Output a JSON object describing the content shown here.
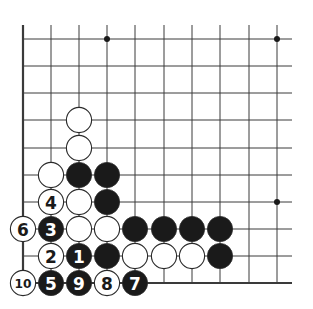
{
  "diagram": {
    "type": "go-board-diagram",
    "line_color": "#3a3a3a",
    "black_color": "#1a1a1a",
    "white_color": "#ffffff",
    "columns_x": [
      23,
      51,
      79,
      107,
      135,
      164,
      192,
      220,
      249,
      277
    ],
    "rows_y": [
      39,
      66,
      93,
      120,
      148,
      175,
      202,
      229,
      256,
      283
    ],
    "line_extent": {
      "top": 25,
      "right": 292
    },
    "edges": [
      "left",
      "bottom"
    ],
    "hoshi": [
      {
        "col": 3,
        "row": 0
      },
      {
        "col": 9,
        "row": 0
      },
      {
        "col": 9,
        "row": 6
      }
    ],
    "stones": [
      {
        "col": 2,
        "row": 3,
        "color": "white",
        "label": ""
      },
      {
        "col": 2,
        "row": 4,
        "color": "white",
        "label": ""
      },
      {
        "col": 1,
        "row": 5,
        "color": "white",
        "label": ""
      },
      {
        "col": 2,
        "row": 5,
        "color": "black",
        "label": ""
      },
      {
        "col": 3,
        "row": 5,
        "color": "black",
        "label": ""
      },
      {
        "col": 1,
        "row": 6,
        "color": "white",
        "label": "4"
      },
      {
        "col": 2,
        "row": 6,
        "color": "white",
        "label": ""
      },
      {
        "col": 3,
        "row": 6,
        "color": "black",
        "label": ""
      },
      {
        "col": 0,
        "row": 7,
        "color": "white",
        "label": "6"
      },
      {
        "col": 1,
        "row": 7,
        "color": "black",
        "label": "3"
      },
      {
        "col": 2,
        "row": 7,
        "color": "white",
        "label": ""
      },
      {
        "col": 3,
        "row": 7,
        "color": "white",
        "label": ""
      },
      {
        "col": 4,
        "row": 7,
        "color": "black",
        "label": ""
      },
      {
        "col": 5,
        "row": 7,
        "color": "black",
        "label": ""
      },
      {
        "col": 6,
        "row": 7,
        "color": "black",
        "label": ""
      },
      {
        "col": 7,
        "row": 7,
        "color": "black",
        "label": ""
      },
      {
        "col": 1,
        "row": 8,
        "color": "white",
        "label": "2"
      },
      {
        "col": 2,
        "row": 8,
        "color": "black",
        "label": "1"
      },
      {
        "col": 3,
        "row": 8,
        "color": "black",
        "label": ""
      },
      {
        "col": 4,
        "row": 8,
        "color": "white",
        "label": ""
      },
      {
        "col": 5,
        "row": 8,
        "color": "white",
        "label": ""
      },
      {
        "col": 6,
        "row": 8,
        "color": "white",
        "label": ""
      },
      {
        "col": 7,
        "row": 8,
        "color": "black",
        "label": ""
      },
      {
        "col": 0,
        "row": 9,
        "color": "white",
        "label": "10"
      },
      {
        "col": 1,
        "row": 9,
        "color": "black",
        "label": "5"
      },
      {
        "col": 2,
        "row": 9,
        "color": "black",
        "label": "9"
      },
      {
        "col": 3,
        "row": 9,
        "color": "white",
        "label": "8"
      },
      {
        "col": 4,
        "row": 9,
        "color": "black",
        "label": "7"
      }
    ]
  }
}
